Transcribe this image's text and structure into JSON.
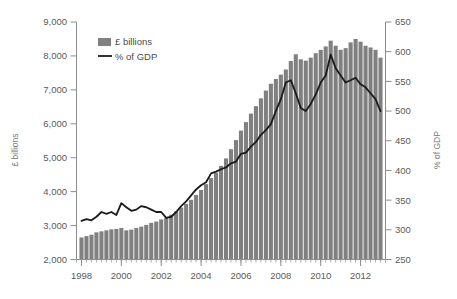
{
  "chart_data": {
    "type": "bar",
    "title": "",
    "subtitle": "",
    "xlabel": "",
    "ylabel": "£ billions",
    "y2label": "% of GDP",
    "grid": false,
    "legend_position": "top-left",
    "ylim": [
      2000,
      9000
    ],
    "y2lim": [
      250,
      650
    ],
    "xlim": [
      1997.75,
      2013.25
    ],
    "ytick_labels": [
      "2,000",
      "3,000",
      "4,000",
      "5,000",
      "6,000",
      "7,000",
      "8,000",
      "9,000"
    ],
    "ytick_values": [
      2000,
      3000,
      4000,
      5000,
      6000,
      7000,
      8000,
      9000
    ],
    "y2tick_labels": [
      "250",
      "300",
      "350",
      "400",
      "450",
      "500",
      "550",
      "600",
      "650"
    ],
    "y2tick_values": [
      250,
      300,
      350,
      400,
      450,
      500,
      550,
      600,
      650
    ],
    "xtick_labels": [
      "1998",
      "2000",
      "2002",
      "2004",
      "2006",
      "2008",
      "2010",
      "2012"
    ],
    "xtick_values": [
      1998,
      2000,
      2002,
      2004,
      2006,
      2008,
      2010,
      2012
    ],
    "legend": [
      {
        "label": "£ billions",
        "marker": "bar",
        "color": "#808080"
      },
      {
        "label": "% of GDP",
        "marker": "line",
        "color": "#1a1a1a"
      }
    ],
    "x": [
      1998.0,
      1998.25,
      1998.5,
      1998.75,
      1999.0,
      1999.25,
      1999.5,
      1999.75,
      2000.0,
      2000.25,
      2000.5,
      2000.75,
      2001.0,
      2001.25,
      2001.5,
      2001.75,
      2002.0,
      2002.25,
      2002.5,
      2002.75,
      2003.0,
      2003.25,
      2003.5,
      2003.75,
      2004.0,
      2004.25,
      2004.5,
      2004.75,
      2005.0,
      2005.25,
      2005.5,
      2005.75,
      2006.0,
      2006.25,
      2006.5,
      2006.75,
      2007.0,
      2007.25,
      2007.5,
      2007.75,
      2008.0,
      2008.25,
      2008.5,
      2008.75,
      2009.0,
      2009.25,
      2009.5,
      2009.75,
      2010.0,
      2010.25,
      2010.5,
      2010.75,
      2011.0,
      2011.25,
      2011.5,
      2011.75,
      2012.0,
      2012.25,
      2012.5,
      2012.75,
      2013.0
    ],
    "series": [
      {
        "name": "£ billions",
        "type": "bar",
        "axis": "left",
        "unit": "£bn",
        "values": [
          2650,
          2690,
          2730,
          2800,
          2830,
          2860,
          2890,
          2900,
          2930,
          2860,
          2880,
          2930,
          2970,
          3020,
          3080,
          3120,
          3180,
          3230,
          3320,
          3420,
          3530,
          3640,
          3760,
          3900,
          4050,
          4220,
          4400,
          4560,
          4760,
          4980,
          5250,
          5520,
          5800,
          6050,
          6300,
          6520,
          6750,
          6980,
          7180,
          7320,
          7450,
          7600,
          7850,
          8050,
          7900,
          7860,
          7950,
          8080,
          8180,
          8280,
          8450,
          8300,
          8180,
          8230,
          8400,
          8500,
          8420,
          8300,
          8250,
          8180,
          7950
        ]
      },
      {
        "name": "% of GDP",
        "type": "line",
        "axis": "right",
        "unit": "%",
        "values": [
          315,
          318,
          316,
          322,
          330,
          327,
          330,
          325,
          345,
          338,
          332,
          334,
          340,
          338,
          334,
          330,
          330,
          320,
          322,
          330,
          340,
          348,
          358,
          368,
          375,
          380,
          395,
          398,
          402,
          405,
          412,
          415,
          428,
          430,
          440,
          448,
          460,
          468,
          478,
          500,
          520,
          548,
          552,
          530,
          505,
          500,
          512,
          528,
          548,
          560,
          595,
          572,
          560,
          548,
          552,
          556,
          545,
          540,
          530,
          520,
          500
        ]
      }
    ]
  }
}
